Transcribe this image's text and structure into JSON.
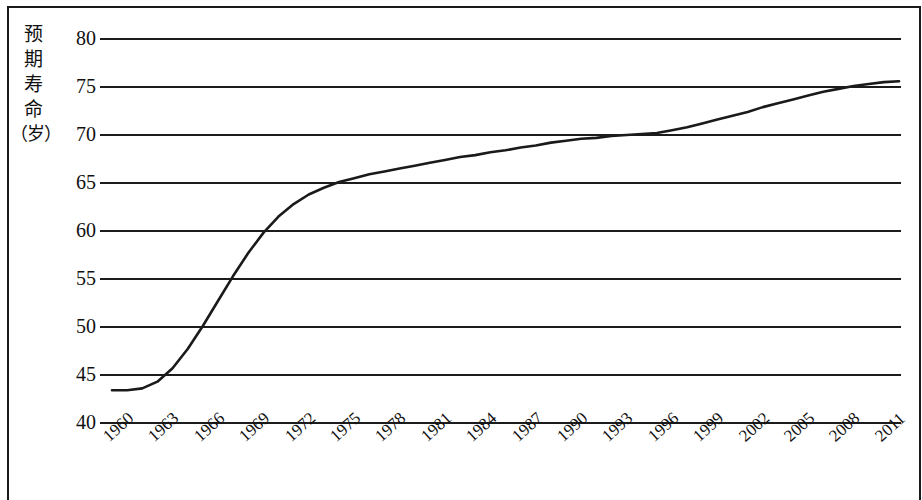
{
  "chart_data": {
    "type": "line",
    "title": "",
    "ylabel": "预期寿命（岁）",
    "ylabel_chars": [
      "预",
      "期",
      "寿",
      "命"
    ],
    "ylabel_unit": "（岁）",
    "xlabel": "年份",
    "ylim": [
      40,
      80
    ],
    "yticks": [
      80,
      75,
      70,
      65,
      60,
      55,
      50,
      45,
      40
    ],
    "xlim": [
      1960,
      2012
    ],
    "xticks": [
      1960,
      1963,
      1966,
      1969,
      1972,
      1975,
      1978,
      1981,
      1984,
      1987,
      1990,
      1993,
      1996,
      1999,
      2002,
      2005,
      2008,
      2011
    ],
    "grid": "horizontal",
    "legend": "none",
    "series": [
      {
        "name": "预期寿命",
        "x": [
          1960,
          1961,
          1962,
          1963,
          1964,
          1965,
          1966,
          1967,
          1968,
          1969,
          1970,
          1971,
          1972,
          1973,
          1974,
          1975,
          1976,
          1977,
          1978,
          1979,
          1980,
          1981,
          1982,
          1983,
          1984,
          1985,
          1986,
          1987,
          1988,
          1989,
          1990,
          1991,
          1992,
          1993,
          1994,
          1995,
          1996,
          1997,
          1998,
          1999,
          2000,
          2001,
          2002,
          2003,
          2004,
          2005,
          2006,
          2007,
          2008,
          2009,
          2010,
          2011,
          2012
        ],
        "values": [
          43.3,
          43.3,
          43.5,
          44.2,
          45.6,
          47.6,
          50.0,
          52.6,
          55.2,
          57.6,
          59.7,
          61.4,
          62.7,
          63.7,
          64.4,
          65.0,
          65.4,
          65.8,
          66.1,
          66.4,
          66.7,
          67.0,
          67.3,
          67.6,
          67.8,
          68.1,
          68.3,
          68.6,
          68.8,
          69.1,
          69.3,
          69.5,
          69.6,
          69.8,
          69.9,
          70.0,
          70.1,
          70.4,
          70.7,
          71.1,
          71.5,
          71.9,
          72.3,
          72.8,
          73.2,
          73.6,
          74.0,
          74.4,
          74.7,
          75.0,
          75.2,
          75.4,
          75.5
        ]
      }
    ]
  },
  "axes": {
    "ytick_labels": [
      "80",
      "75",
      "70",
      "65",
      "60",
      "55",
      "50",
      "45",
      "40"
    ],
    "xtick_labels": [
      "1960",
      "1963",
      "1966",
      "1969",
      "1972",
      "1975",
      "1978",
      "1981",
      "1984",
      "1987",
      "1990",
      "1993",
      "1996",
      "1999",
      "2002",
      "2005",
      "2008",
      "2011"
    ],
    "xaxis_title": "年份"
  },
  "style": {
    "line_color": "#1a1a1a",
    "grid_color": "#1c1c1c",
    "background": "#ffffff"
  }
}
